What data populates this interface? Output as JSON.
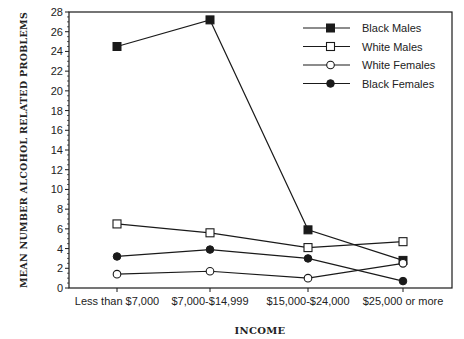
{
  "chart_data": {
    "type": "line",
    "title": "",
    "xlabel": "INCOME",
    "ylabel": "MEAN NUMBER ALCOHOL RELATED PROBLEMS",
    "categories": [
      "Less than $7,000",
      "$7,000-$14,999",
      "$15,000-$24,000",
      "$25,000 or more"
    ],
    "ylim": [
      0,
      28
    ],
    "yticks": [
      0,
      2,
      4,
      6,
      8,
      10,
      12,
      14,
      16,
      18,
      20,
      22,
      24,
      26,
      28
    ],
    "grid": false,
    "legend_position": "upper right",
    "series": [
      {
        "name": "Black Males",
        "marker": "filled-square",
        "values": [
          24.5,
          27.2,
          5.9,
          2.8
        ]
      },
      {
        "name": "White Males",
        "marker": "open-square",
        "values": [
          6.5,
          5.6,
          4.1,
          4.7
        ]
      },
      {
        "name": "White Females",
        "marker": "open-circle",
        "values": [
          1.4,
          1.7,
          1.0,
          2.5
        ]
      },
      {
        "name": "Black Females",
        "marker": "filled-circle",
        "values": [
          3.2,
          3.9,
          3.0,
          0.7
        ]
      }
    ]
  },
  "colors": {
    "line": "#1a1a1a",
    "text": "#222222",
    "background": "#ffffff"
  }
}
